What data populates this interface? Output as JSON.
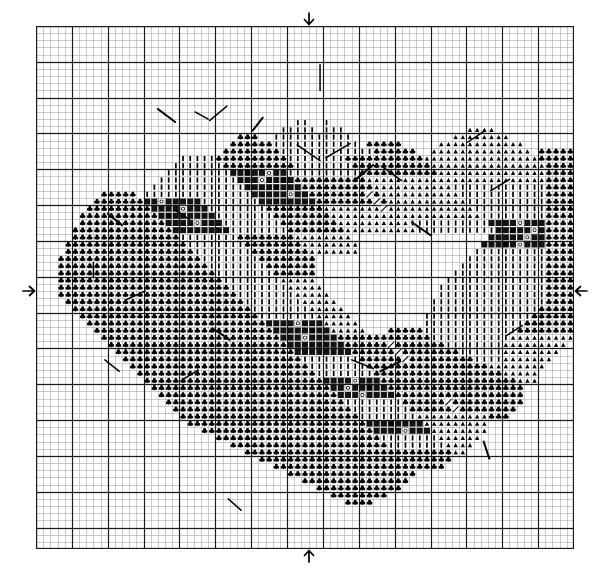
{
  "document": {
    "type": "cross-stitch-pattern-chart",
    "title": "Floral Wreath Cross Stitch Chart",
    "description": "Counted cross stitch grid chart depicting a circular floral wreath with an open (unstitched) center."
  },
  "grid": {
    "columns": 75,
    "rows": 73,
    "cell_px": 7.17,
    "origin_x_px": 36,
    "origin_y_px": 26,
    "width_px": 538,
    "height_px": 523,
    "minor_line_color": "#9a9a9a",
    "major_line_color": "#1a1a1a",
    "major_every": 5,
    "background": "#ffffff"
  },
  "center_markers": [
    {
      "name": "top-center-arrow",
      "glyph": "↓",
      "edge": "top",
      "cell": 38
    },
    {
      "name": "bottom-center-arrow",
      "glyph": "↑",
      "edge": "bottom",
      "cell": 38
    },
    {
      "name": "left-center-arrow",
      "glyph": "→",
      "edge": "left",
      "cell": 37
    },
    {
      "name": "right-center-arrow",
      "glyph": "←",
      "edge": "right",
      "cell": 37
    }
  ],
  "symbol_key": [
    {
      "id": "club",
      "glyph": "♣",
      "name": "club-symbol",
      "color": "#000000"
    },
    {
      "id": "tri",
      "glyph": "▲",
      "name": "triangle-symbol",
      "color": "#000000"
    },
    {
      "id": "bar",
      "glyph": "|",
      "name": "vertical-bar-symbol",
      "color": "#000000"
    },
    {
      "id": "fill",
      "glyph": "█",
      "name": "filled-block-symbol",
      "color": "#111111"
    },
    {
      "id": "dot",
      "glyph": "○",
      "name": "open-circle-symbol",
      "color": "#000000"
    },
    {
      "id": "blk",
      "glyph": "▮",
      "name": "solid-dark-symbol",
      "color": "#000000"
    }
  ],
  "chart_data": {
    "type": "heatmap",
    "xlabel": "",
    "ylabel": "",
    "grid": true,
    "legend": "none",
    "xlim": [
      0,
      75
    ],
    "ylim": [
      0,
      73
    ],
    "categories": [
      "club",
      "tri",
      "bar",
      "fill",
      "dot",
      "blk"
    ],
    "note": "Each run is [row, start_col, end_col, symbol_id]; rows/cols are zero-based from top-left of the chart grid.",
    "runs": [
      [
        13,
        36,
        37,
        "bar"
      ],
      [
        13,
        40,
        40,
        "bar"
      ],
      [
        14,
        34,
        38,
        "bar"
      ],
      [
        14,
        40,
        42,
        "bar"
      ],
      [
        14,
        60,
        63,
        "tri"
      ],
      [
        15,
        28,
        30,
        "club"
      ],
      [
        15,
        33,
        39,
        "bar"
      ],
      [
        15,
        40,
        43,
        "bar"
      ],
      [
        15,
        58,
        65,
        "tri"
      ],
      [
        16,
        27,
        32,
        "club"
      ],
      [
        16,
        33,
        40,
        "bar"
      ],
      [
        16,
        41,
        44,
        "bar"
      ],
      [
        16,
        46,
        50,
        "club"
      ],
      [
        16,
        56,
        67,
        "tri"
      ],
      [
        17,
        26,
        33,
        "club"
      ],
      [
        17,
        34,
        41,
        "bar"
      ],
      [
        17,
        42,
        46,
        "bar"
      ],
      [
        17,
        47,
        52,
        "club"
      ],
      [
        17,
        55,
        68,
        "tri"
      ],
      [
        17,
        70,
        74,
        "club"
      ],
      [
        18,
        20,
        24,
        "bar"
      ],
      [
        18,
        25,
        34,
        "club"
      ],
      [
        18,
        35,
        42,
        "bar"
      ],
      [
        18,
        43,
        47,
        "club"
      ],
      [
        18,
        48,
        53,
        "club"
      ],
      [
        18,
        54,
        69,
        "tri"
      ],
      [
        18,
        70,
        76,
        "club"
      ],
      [
        19,
        19,
        25,
        "bar"
      ],
      [
        19,
        26,
        35,
        "club"
      ],
      [
        19,
        36,
        43,
        "bar"
      ],
      [
        19,
        44,
        54,
        "club"
      ],
      [
        19,
        55,
        70,
        "tri"
      ],
      [
        19,
        71,
        77,
        "club"
      ],
      [
        20,
        18,
        26,
        "bar"
      ],
      [
        20,
        27,
        34,
        "fill"
      ],
      [
        20,
        35,
        44,
        "bar"
      ],
      [
        20,
        45,
        55,
        "club"
      ],
      [
        20,
        56,
        70,
        "tri"
      ],
      [
        20,
        71,
        78,
        "club"
      ],
      [
        21,
        17,
        27,
        "bar"
      ],
      [
        21,
        28,
        35,
        "fill"
      ],
      [
        21,
        36,
        45,
        "club"
      ],
      [
        21,
        46,
        56,
        "tri"
      ],
      [
        21,
        57,
        70,
        "tri"
      ],
      [
        21,
        71,
        78,
        "club"
      ],
      [
        22,
        16,
        28,
        "bar"
      ],
      [
        22,
        29,
        36,
        "fill"
      ],
      [
        22,
        37,
        46,
        "club"
      ],
      [
        22,
        47,
        57,
        "tri"
      ],
      [
        22,
        58,
        70,
        "bar"
      ],
      [
        22,
        71,
        78,
        "club"
      ],
      [
        23,
        9,
        13,
        "club"
      ],
      [
        23,
        15,
        29,
        "bar"
      ],
      [
        23,
        30,
        37,
        "fill"
      ],
      [
        23,
        38,
        47,
        "club"
      ],
      [
        23,
        48,
        58,
        "tri"
      ],
      [
        23,
        59,
        70,
        "bar"
      ],
      [
        23,
        71,
        78,
        "club"
      ],
      [
        24,
        8,
        14,
        "club"
      ],
      [
        24,
        15,
        22,
        "fill"
      ],
      [
        24,
        23,
        30,
        "bar"
      ],
      [
        24,
        31,
        38,
        "fill"
      ],
      [
        24,
        39,
        48,
        "club"
      ],
      [
        24,
        49,
        59,
        "tri"
      ],
      [
        24,
        60,
        70,
        "bar"
      ],
      [
        24,
        71,
        79,
        "club"
      ],
      [
        25,
        7,
        15,
        "club"
      ],
      [
        25,
        16,
        23,
        "fill"
      ],
      [
        25,
        24,
        31,
        "bar"
      ],
      [
        25,
        32,
        39,
        "club"
      ],
      [
        25,
        40,
        49,
        "tri"
      ],
      [
        25,
        50,
        60,
        "tri"
      ],
      [
        25,
        61,
        70,
        "bar"
      ],
      [
        25,
        71,
        79,
        "club"
      ],
      [
        26,
        6,
        16,
        "club"
      ],
      [
        26,
        17,
        24,
        "fill"
      ],
      [
        26,
        25,
        32,
        "bar"
      ],
      [
        26,
        33,
        40,
        "club"
      ],
      [
        26,
        41,
        50,
        "tri"
      ],
      [
        26,
        51,
        61,
        "tri"
      ],
      [
        26,
        62,
        70,
        "bar"
      ],
      [
        26,
        71,
        79,
        "club"
      ],
      [
        27,
        6,
        17,
        "club"
      ],
      [
        27,
        18,
        25,
        "fill"
      ],
      [
        27,
        26,
        33,
        "bar"
      ],
      [
        27,
        34,
        41,
        "club"
      ],
      [
        27,
        42,
        51,
        "tri"
      ],
      [
        27,
        52,
        62,
        "bar"
      ],
      [
        27,
        63,
        70,
        "fill"
      ],
      [
        27,
        71,
        80,
        "club"
      ],
      [
        28,
        5,
        18,
        "club"
      ],
      [
        28,
        19,
        26,
        "fill"
      ],
      [
        28,
        27,
        34,
        "bar"
      ],
      [
        28,
        35,
        42,
        "club"
      ],
      [
        28,
        43,
        52,
        "tri"
      ],
      [
        28,
        53,
        63,
        "bar"
      ],
      [
        28,
        64,
        70,
        "fill"
      ],
      [
        28,
        71,
        80,
        "club"
      ],
      [
        29,
        5,
        19,
        "club"
      ],
      [
        29,
        20,
        27,
        "bar"
      ],
      [
        29,
        28,
        35,
        "club"
      ],
      [
        29,
        36,
        43,
        "tri"
      ],
      [
        29,
        63,
        70,
        "fill"
      ],
      [
        29,
        71,
        80,
        "club"
      ],
      [
        30,
        4,
        20,
        "club"
      ],
      [
        30,
        21,
        28,
        "bar"
      ],
      [
        30,
        29,
        36,
        "club"
      ],
      [
        30,
        37,
        44,
        "tri"
      ],
      [
        30,
        62,
        70,
        "fill"
      ],
      [
        30,
        71,
        80,
        "club"
      ],
      [
        31,
        4,
        21,
        "club"
      ],
      [
        31,
        22,
        29,
        "bar"
      ],
      [
        31,
        30,
        37,
        "club"
      ],
      [
        31,
        38,
        44,
        "tri"
      ],
      [
        31,
        61,
        70,
        "bar"
      ],
      [
        31,
        71,
        80,
        "club"
      ],
      [
        32,
        3,
        22,
        "club"
      ],
      [
        32,
        23,
        30,
        "bar"
      ],
      [
        32,
        31,
        38,
        "club"
      ],
      [
        32,
        60,
        70,
        "bar"
      ],
      [
        32,
        71,
        80,
        "club"
      ],
      [
        33,
        3,
        23,
        "club"
      ],
      [
        33,
        24,
        31,
        "bar"
      ],
      [
        33,
        32,
        38,
        "club"
      ],
      [
        33,
        59,
        70,
        "bar"
      ],
      [
        33,
        71,
        80,
        "club"
      ],
      [
        34,
        3,
        24,
        "club"
      ],
      [
        34,
        25,
        32,
        "bar"
      ],
      [
        34,
        33,
        38,
        "club"
      ],
      [
        34,
        58,
        70,
        "bar"
      ],
      [
        34,
        71,
        80,
        "club"
      ],
      [
        35,
        3,
        25,
        "club"
      ],
      [
        35,
        26,
        33,
        "bar"
      ],
      [
        35,
        34,
        38,
        "tri"
      ],
      [
        35,
        57,
        70,
        "bar"
      ],
      [
        35,
        71,
        80,
        "club"
      ],
      [
        36,
        3,
        26,
        "club"
      ],
      [
        36,
        27,
        34,
        "bar"
      ],
      [
        36,
        35,
        39,
        "tri"
      ],
      [
        36,
        56,
        70,
        "bar"
      ],
      [
        36,
        71,
        80,
        "club"
      ],
      [
        37,
        3,
        27,
        "club"
      ],
      [
        37,
        28,
        35,
        "bar"
      ],
      [
        37,
        36,
        40,
        "tri"
      ],
      [
        37,
        56,
        70,
        "bar"
      ],
      [
        37,
        71,
        80,
        "club"
      ],
      [
        38,
        4,
        28,
        "club"
      ],
      [
        38,
        29,
        36,
        "bar"
      ],
      [
        38,
        37,
        41,
        "tri"
      ],
      [
        38,
        55,
        70,
        "bar"
      ],
      [
        38,
        71,
        79,
        "club"
      ],
      [
        39,
        5,
        29,
        "club"
      ],
      [
        39,
        30,
        37,
        "bar"
      ],
      [
        39,
        38,
        42,
        "tri"
      ],
      [
        39,
        55,
        69,
        "bar"
      ],
      [
        39,
        70,
        78,
        "club"
      ],
      [
        40,
        6,
        30,
        "club"
      ],
      [
        40,
        31,
        38,
        "bar"
      ],
      [
        40,
        39,
        43,
        "tri"
      ],
      [
        40,
        54,
        68,
        "bar"
      ],
      [
        40,
        69,
        77,
        "club"
      ],
      [
        41,
        7,
        31,
        "club"
      ],
      [
        41,
        32,
        39,
        "fill"
      ],
      [
        41,
        40,
        44,
        "tri"
      ],
      [
        41,
        54,
        67,
        "bar"
      ],
      [
        41,
        68,
        76,
        "club"
      ],
      [
        42,
        8,
        32,
        "club"
      ],
      [
        42,
        33,
        40,
        "fill"
      ],
      [
        42,
        41,
        45,
        "tri"
      ],
      [
        42,
        49,
        53,
        "club"
      ],
      [
        42,
        54,
        66,
        "bar"
      ],
      [
        42,
        67,
        75,
        "club"
      ],
      [
        43,
        9,
        33,
        "club"
      ],
      [
        43,
        34,
        41,
        "fill"
      ],
      [
        43,
        42,
        47,
        "club"
      ],
      [
        43,
        48,
        54,
        "club"
      ],
      [
        43,
        55,
        65,
        "bar"
      ],
      [
        43,
        66,
        74,
        "tri"
      ],
      [
        44,
        10,
        34,
        "club"
      ],
      [
        44,
        35,
        42,
        "fill"
      ],
      [
        44,
        43,
        49,
        "club"
      ],
      [
        44,
        50,
        56,
        "club"
      ],
      [
        44,
        57,
        64,
        "bar"
      ],
      [
        44,
        65,
        73,
        "tri"
      ],
      [
        45,
        11,
        35,
        "club"
      ],
      [
        45,
        36,
        43,
        "fill"
      ],
      [
        45,
        44,
        51,
        "club"
      ],
      [
        45,
        52,
        58,
        "club"
      ],
      [
        45,
        59,
        64,
        "bar"
      ],
      [
        45,
        65,
        72,
        "tri"
      ],
      [
        46,
        12,
        36,
        "club"
      ],
      [
        46,
        37,
        44,
        "bar"
      ],
      [
        46,
        45,
        53,
        "club"
      ],
      [
        46,
        54,
        60,
        "club"
      ],
      [
        46,
        61,
        64,
        "bar"
      ],
      [
        46,
        65,
        71,
        "tri"
      ],
      [
        47,
        13,
        37,
        "club"
      ],
      [
        47,
        38,
        45,
        "bar"
      ],
      [
        47,
        46,
        55,
        "club"
      ],
      [
        47,
        56,
        62,
        "club"
      ],
      [
        47,
        63,
        70,
        "tri"
      ],
      [
        48,
        14,
        38,
        "club"
      ],
      [
        48,
        39,
        46,
        "bar"
      ],
      [
        48,
        47,
        57,
        "club"
      ],
      [
        48,
        58,
        64,
        "club"
      ],
      [
        48,
        65,
        69,
        "tri"
      ],
      [
        49,
        15,
        39,
        "club"
      ],
      [
        49,
        40,
        47,
        "fill"
      ],
      [
        49,
        48,
        58,
        "club"
      ],
      [
        49,
        59,
        66,
        "club"
      ],
      [
        49,
        67,
        69,
        "tri"
      ],
      [
        50,
        16,
        40,
        "club"
      ],
      [
        50,
        41,
        48,
        "fill"
      ],
      [
        50,
        49,
        59,
        "club"
      ],
      [
        50,
        60,
        67,
        "club"
      ],
      [
        51,
        17,
        41,
        "club"
      ],
      [
        51,
        42,
        49,
        "fill"
      ],
      [
        51,
        50,
        60,
        "club"
      ],
      [
        51,
        61,
        67,
        "club"
      ],
      [
        52,
        18,
        42,
        "club"
      ],
      [
        52,
        43,
        50,
        "bar"
      ],
      [
        52,
        51,
        61,
        "club"
      ],
      [
        52,
        62,
        67,
        "club"
      ],
      [
        53,
        19,
        43,
        "club"
      ],
      [
        53,
        44,
        51,
        "bar"
      ],
      [
        53,
        52,
        62,
        "club"
      ],
      [
        53,
        63,
        66,
        "club"
      ],
      [
        54,
        20,
        44,
        "club"
      ],
      [
        54,
        45,
        52,
        "bar"
      ],
      [
        54,
        53,
        62,
        "tri"
      ],
      [
        54,
        63,
        65,
        "club"
      ],
      [
        55,
        21,
        45,
        "club"
      ],
      [
        55,
        46,
        53,
        "fill"
      ],
      [
        55,
        54,
        62,
        "tri"
      ],
      [
        56,
        23,
        46,
        "club"
      ],
      [
        56,
        47,
        54,
        "fill"
      ],
      [
        56,
        55,
        62,
        "tri"
      ],
      [
        57,
        25,
        47,
        "club"
      ],
      [
        57,
        48,
        55,
        "bar"
      ],
      [
        57,
        56,
        61,
        "tri"
      ],
      [
        58,
        27,
        48,
        "club"
      ],
      [
        58,
        49,
        56,
        "bar"
      ],
      [
        58,
        57,
        60,
        "tri"
      ],
      [
        59,
        29,
        49,
        "club"
      ],
      [
        59,
        50,
        57,
        "club"
      ],
      [
        59,
        58,
        59,
        "tri"
      ],
      [
        60,
        31,
        50,
        "club"
      ],
      [
        60,
        51,
        57,
        "club"
      ],
      [
        61,
        33,
        51,
        "club"
      ],
      [
        61,
        52,
        56,
        "club"
      ],
      [
        62,
        35,
        52,
        "club"
      ],
      [
        63,
        37,
        51,
        "club"
      ],
      [
        64,
        39,
        50,
        "club"
      ],
      [
        65,
        41,
        48,
        "club"
      ],
      [
        66,
        43,
        46,
        "club"
      ]
    ]
  },
  "backstitch_lines": {
    "name": "backstitch-overlay",
    "color": "#000000",
    "count": 22
  }
}
